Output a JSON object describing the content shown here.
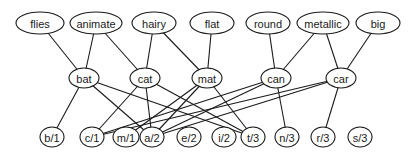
{
  "diagram": {
    "title": "",
    "colors": {
      "stroke": "#1a1a1a",
      "fill": "#ffffff"
    },
    "layers": {
      "features": [
        {
          "id": "flies",
          "label": "flies",
          "x": 40,
          "y": 23,
          "rx": 24,
          "ry": 11
        },
        {
          "id": "animate",
          "label": "animate",
          "x": 96,
          "y": 23,
          "rx": 26,
          "ry": 11
        },
        {
          "id": "hairy",
          "label": "hairy",
          "x": 154,
          "y": 23,
          "rx": 22,
          "ry": 11
        },
        {
          "id": "flat",
          "label": "flat",
          "x": 212,
          "y": 23,
          "rx": 22,
          "ry": 11
        },
        {
          "id": "round",
          "label": "round",
          "x": 268,
          "y": 23,
          "rx": 22,
          "ry": 11
        },
        {
          "id": "metallic",
          "label": "metallic",
          "x": 323,
          "y": 23,
          "rx": 26,
          "ry": 11
        },
        {
          "id": "big",
          "label": "big",
          "x": 378,
          "y": 23,
          "rx": 22,
          "ry": 11
        }
      ],
      "words": [
        {
          "id": "bat",
          "label": "bat",
          "x": 84,
          "y": 78,
          "rx": 15,
          "ry": 10
        },
        {
          "id": "cat",
          "label": "cat",
          "x": 145,
          "y": 78,
          "rx": 15,
          "ry": 10
        },
        {
          "id": "mat",
          "label": "mat",
          "x": 207,
          "y": 78,
          "rx": 15,
          "ry": 10
        },
        {
          "id": "can",
          "label": "can",
          "x": 276,
          "y": 78,
          "rx": 15,
          "ry": 10
        },
        {
          "id": "car",
          "label": "car",
          "x": 341,
          "y": 78,
          "rx": 15,
          "ry": 10
        }
      ],
      "letters": [
        {
          "id": "b1",
          "label": "b/1",
          "x": 52,
          "y": 137,
          "rx": 12,
          "ry": 10
        },
        {
          "id": "c1",
          "label": "c/1",
          "x": 92,
          "y": 137,
          "rx": 12,
          "ry": 10
        },
        {
          "id": "m1",
          "label": "m/1",
          "x": 126,
          "y": 137,
          "rx": 13,
          "ry": 10
        },
        {
          "id": "a2",
          "label": "a/2",
          "x": 152,
          "y": 137,
          "rx": 12,
          "ry": 10
        },
        {
          "id": "e2",
          "label": "e/2",
          "x": 189,
          "y": 137,
          "rx": 12,
          "ry": 10
        },
        {
          "id": "i2",
          "label": "i/2",
          "x": 224,
          "y": 137,
          "rx": 12,
          "ry": 10
        },
        {
          "id": "t3",
          "label": "t/3",
          "x": 253,
          "y": 137,
          "rx": 12,
          "ry": 10
        },
        {
          "id": "n3",
          "label": "n/3",
          "x": 287,
          "y": 137,
          "rx": 12,
          "ry": 10
        },
        {
          "id": "r3",
          "label": "r/3",
          "x": 323,
          "y": 137,
          "rx": 12,
          "ry": 10
        },
        {
          "id": "s3",
          "label": "s/3",
          "x": 360,
          "y": 137,
          "rx": 12,
          "ry": 10
        }
      ]
    },
    "edges": [
      [
        "flies",
        "bat"
      ],
      [
        "animate",
        "bat"
      ],
      [
        "animate",
        "cat"
      ],
      [
        "hairy",
        "cat"
      ],
      [
        "hairy",
        "mat"
      ],
      [
        "flat",
        "mat"
      ],
      [
        "round",
        "can"
      ],
      [
        "metallic",
        "can"
      ],
      [
        "metallic",
        "car"
      ],
      [
        "big",
        "car"
      ],
      [
        "bat",
        "b1"
      ],
      [
        "bat",
        "a2"
      ],
      [
        "bat",
        "t3"
      ],
      [
        "cat",
        "c1"
      ],
      [
        "cat",
        "a2"
      ],
      [
        "cat",
        "t3"
      ],
      [
        "mat",
        "m1"
      ],
      [
        "mat",
        "a2"
      ],
      [
        "mat",
        "t3"
      ],
      [
        "can",
        "c1"
      ],
      [
        "can",
        "a2"
      ],
      [
        "can",
        "n3"
      ],
      [
        "car",
        "c1"
      ],
      [
        "car",
        "a2"
      ],
      [
        "car",
        "r3"
      ]
    ]
  }
}
